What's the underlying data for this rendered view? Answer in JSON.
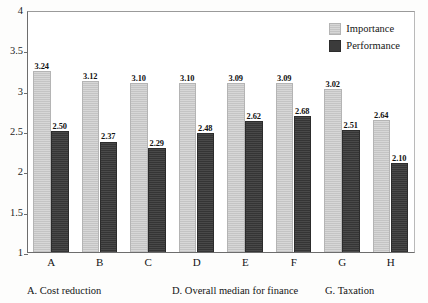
{
  "chart_data": {
    "type": "bar",
    "title": "",
    "subtitle": "",
    "xlabel": "",
    "ylabel": "",
    "ylim": [
      1,
      4
    ],
    "yticks": [
      "1",
      "1.5",
      "2",
      "2.5",
      "3",
      "3.5",
      "4"
    ],
    "ytick_values": [
      1,
      1.5,
      2,
      2.5,
      3,
      3.5,
      4
    ],
    "grid": false,
    "legend_position": "top-right-inside",
    "categories": [
      "A",
      "B",
      "C",
      "D",
      "E",
      "F",
      "G",
      "H"
    ],
    "series": [
      {
        "name": "Importance",
        "color": "#c9c9c9",
        "values": [
          3.24,
          3.12,
          3.1,
          3.1,
          3.09,
          3.09,
          3.02,
          2.64
        ],
        "labels": [
          "3.24",
          "3.12",
          "3.10",
          "3.10",
          "3.09",
          "3.09",
          "3.02",
          "2.64"
        ]
      },
      {
        "name": "Performance",
        "color": "#3b3b3b",
        "values": [
          2.5,
          2.37,
          2.29,
          2.48,
          2.62,
          2.68,
          2.51,
          2.1
        ],
        "labels": [
          "2.50",
          "2.37",
          "2.29",
          "2.48",
          "2.62",
          "2.68",
          "2.51",
          "2.10"
        ]
      }
    ],
    "annotations": [
      "A. Cost reduction",
      "D. Overall median for finance",
      "G. Taxation"
    ]
  },
  "legend": {
    "items": [
      {
        "label": "Importance",
        "swatch": "importance-swatch"
      },
      {
        "label": "Performance",
        "swatch": "performance-swatch"
      }
    ]
  },
  "footnote": {
    "items": [
      {
        "text": "A.  Cost reduction"
      },
      {
        "text": "D.  Overall median for finance"
      },
      {
        "text": "G.  Taxation"
      }
    ]
  },
  "top_sliver": {
    "text": ""
  }
}
